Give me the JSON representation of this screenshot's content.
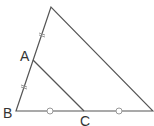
{
  "figure": {
    "type": "triangle-midpoint-diagram",
    "line_color": "#555555",
    "mark_color": "#999999",
    "points": {
      "apex": {
        "x": 51,
        "y": 7
      },
      "A": {
        "x": 33,
        "y": 60,
        "label": "A"
      },
      "B": {
        "x": 16,
        "y": 111,
        "label": "B"
      },
      "C": {
        "x": 84,
        "y": 111,
        "label": "C"
      },
      "right": {
        "x": 153,
        "y": 111
      }
    },
    "labels": {
      "A": "A",
      "B": "B",
      "C": "C"
    },
    "equal_marks": {
      "ticks": [
        {
          "x": 42,
          "y": 34
        },
        {
          "x": 24,
          "y": 86
        }
      ],
      "circles": [
        {
          "x": 50,
          "y": 111
        },
        {
          "x": 119,
          "y": 111
        }
      ]
    }
  }
}
